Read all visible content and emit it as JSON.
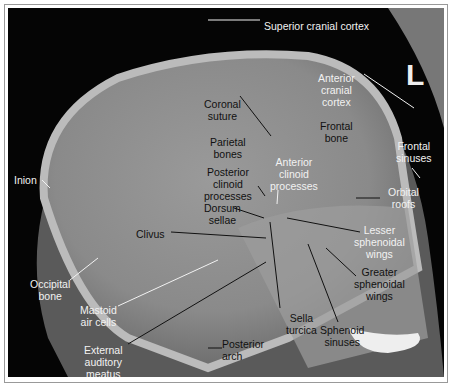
{
  "figure": {
    "orientation_marker": "L",
    "labels": [
      {
        "id": "superior-cranial-cortex",
        "text": "Superior cranial cortex",
        "x": 256,
        "y": 12,
        "color": "w",
        "align": "left"
      },
      {
        "id": "anterior-cranial-cortex",
        "text": "Anterior\ncranial\ncortex",
        "x": 310,
        "y": 64,
        "color": "w"
      },
      {
        "id": "coronal-suture",
        "text": "Coronal\nsuture",
        "x": 196,
        "y": 90,
        "color": "b"
      },
      {
        "id": "frontal-bone",
        "text": "Frontal\nbone",
        "x": 312,
        "y": 112,
        "color": "b"
      },
      {
        "id": "parietal-bones",
        "text": "Parietal\nbones",
        "x": 202,
        "y": 128,
        "color": "b"
      },
      {
        "id": "anterior-clinoid-processes",
        "text": "Anterior\nclinoid\nprocesses",
        "x": 262,
        "y": 148,
        "color": "w"
      },
      {
        "id": "frontal-sinuses",
        "text": "Frontal\nsinuses",
        "x": 388,
        "y": 132,
        "color": "w"
      },
      {
        "id": "posterior-clinoid-processes",
        "text": "Posterior\nclinoid\nprocesses",
        "x": 196,
        "y": 158,
        "color": "b"
      },
      {
        "id": "orbital-roofs",
        "text": "Orbital\nroofs",
        "x": 380,
        "y": 178,
        "color": "w"
      },
      {
        "id": "dorsum-sellae",
        "text": "Dorsum\nsellae",
        "x": 196,
        "y": 194,
        "color": "b"
      },
      {
        "id": "inion",
        "text": "Inion",
        "x": 6,
        "y": 166,
        "color": "w",
        "align": "left"
      },
      {
        "id": "clivus",
        "text": "Clivus",
        "x": 128,
        "y": 220,
        "color": "b",
        "align": "left"
      },
      {
        "id": "lesser-sphenoidal-wings",
        "text": "Lesser\nsphenoidal\nwings",
        "x": 346,
        "y": 216,
        "color": "w"
      },
      {
        "id": "greater-sphenoidal-wings",
        "text": "Greater\nsphenoidal\nwings",
        "x": 346,
        "y": 258,
        "color": "b"
      },
      {
        "id": "occipital-bone",
        "text": "Occipital\nbone",
        "x": 22,
        "y": 270,
        "color": "w"
      },
      {
        "id": "mastoid-air-cells",
        "text": "Mastoid\nair cells",
        "x": 72,
        "y": 296,
        "color": "w"
      },
      {
        "id": "sella-turcica",
        "text": "Sella\nturcica",
        "x": 278,
        "y": 304,
        "color": "b"
      },
      {
        "id": "sphenoid-sinuses",
        "text": "Sphenoid\nsinuses",
        "x": 312,
        "y": 316,
        "color": "b"
      },
      {
        "id": "external-auditory-meatus",
        "text": "External\nauditory\nmeatus",
        "x": 76,
        "y": 336,
        "color": "w"
      },
      {
        "id": "posterior-arch",
        "text": "Posterior\narch",
        "x": 214,
        "y": 330,
        "color": "b",
        "align": "left"
      }
    ]
  }
}
